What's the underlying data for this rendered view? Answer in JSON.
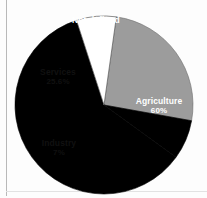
{
  "chart_data": {
    "type": "pie",
    "title": "",
    "subtitle": "",
    "xlabel": "",
    "ylabel": "",
    "legend_position": "none",
    "grid": false,
    "labels_inside_slices": true,
    "categories": [
      "Agriculture",
      "Services",
      "Industry",
      "Not defined"
    ],
    "values": [
      60,
      25.6,
      7,
      7
    ],
    "value_labels": [
      "60%",
      "25.6%",
      "7%",
      "7%"
    ],
    "colors": [
      "#000000",
      "#9c9c9c",
      "#ffffff",
      "#000000"
    ],
    "slices": [
      {
        "name": "Agriculture",
        "value": 60,
        "value_label": "60%",
        "color": "#000000",
        "text_color": "#ffffff",
        "start_angle_deg": 36,
        "end_angle_deg": 252
      },
      {
        "name": "Services",
        "value": 25.6,
        "value_label": "25.6%",
        "color": "#9c9c9c",
        "text_color": "#111111",
        "start_angle_deg": 278,
        "end_angle_deg": 370.2
      },
      {
        "name": "Industry",
        "value": 7,
        "value_label": "7%",
        "color": "#ffffff",
        "text_color": "#111111",
        "start_angle_deg": 252,
        "end_angle_deg": 278
      },
      {
        "name": "Not defined",
        "value": 7,
        "value_label": "7%",
        "color": "#000000",
        "text_color": "#ffffff",
        "start_angle_deg": 10.2,
        "end_angle_deg": 36
      }
    ],
    "geometry": {
      "center_x": 104,
      "center_y": 105,
      "radius": 89
    }
  },
  "figure": {
    "background": "#fdfdfd",
    "rule_color": "#b9b9b9"
  }
}
